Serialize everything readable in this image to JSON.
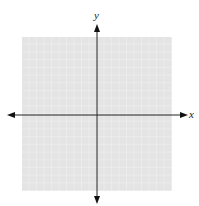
{
  "header": {
    "partial_text": "Sketch the",
    "partial_var": "y"
  },
  "graph": {
    "x_label": "x",
    "y_label": "y",
    "grid_cells_x": 20,
    "grid_cells_y": 20,
    "grid_background": "#e6e6e6",
    "grid_line_color": "#f6f6f6",
    "axis_color": "#222222"
  }
}
